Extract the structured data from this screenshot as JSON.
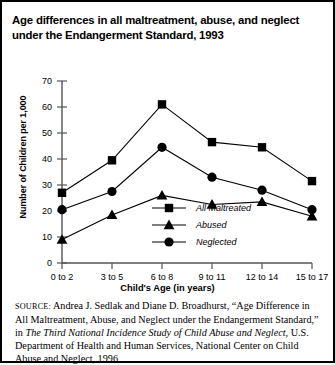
{
  "figure": {
    "title": "Age differences in all maltreatment, abuse, and neglect under the Endangerment Standard, 1993",
    "source_label": "SOURCE:",
    "source_part1": " Andrea J. Sedlak and Diane D. Broadhurst, “Age Difference in All Maltreatment, Abuse, and Neglect under the Endangerment Standard,” in ",
    "source_italic": "The Third National Incidence Study of Child Abuse and Neglect",
    "source_part2": ", U.S. Department of Health and Human Services, National Center on Child Abuse and Neglect, 1996"
  },
  "chart_data": {
    "type": "line",
    "title": "Age differences in all maltreatment, abuse, and neglect under the Endangerment Standard, 1993",
    "xlabel": "Child's Age (in years)",
    "ylabel": "Number of Children per 1,000",
    "categories": [
      "0 to 2",
      "3 to 5",
      "6 to 8",
      "9 to 11",
      "12 to 14",
      "15 to 17"
    ],
    "ylim": [
      0,
      70
    ],
    "yticks": [
      0,
      10,
      20,
      30,
      40,
      50,
      60,
      70
    ],
    "grid": false,
    "legend_position": "inside-center",
    "series": [
      {
        "name": "All Maltreated",
        "marker": "square",
        "color": "#000000",
        "values": [
          27,
          39.5,
          61,
          46.5,
          44.5,
          31.5
        ]
      },
      {
        "name": "Abused",
        "marker": "triangle",
        "color": "#000000",
        "values": [
          9,
          18.5,
          26,
          22.5,
          23.5,
          18
        ]
      },
      {
        "name": "Neglected",
        "marker": "circle",
        "color": "#000000",
        "values": [
          20.5,
          27.5,
          44.5,
          33,
          28,
          20.5
        ]
      }
    ]
  }
}
